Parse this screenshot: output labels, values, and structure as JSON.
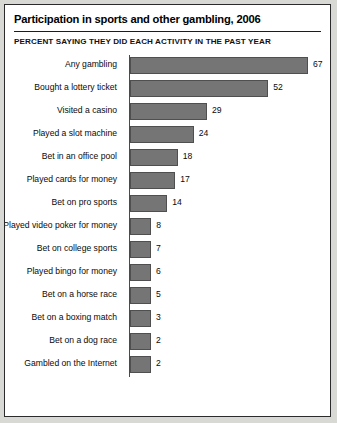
{
  "chart_data": {
    "type": "bar",
    "orientation": "horizontal",
    "title": "Participation in sports and other gambling, 2006",
    "subtitle": "PERCENT SAYING THEY DID EACH ACTIVITY IN THE PAST YEAR",
    "xlabel": "",
    "ylabel": "",
    "xlim": [
      0,
      67
    ],
    "grid": false,
    "legend": false,
    "bar_color": "#757575",
    "bar_border_color": "#4f4f4f",
    "axis_color": "#4a4a4a",
    "background": "#ffffff",
    "categories": [
      "Any gambling",
      "Bought a lottery ticket",
      "Visited a casino",
      "Played a slot machine",
      "Bet in an office pool",
      "Played cards for money",
      "Bet on pro sports",
      "Played video poker for money",
      "Bet on college sports",
      "Played bingo for money",
      "Bet on a horse race",
      "Bet on a boxing match",
      "Bet on a dog race",
      "Gambled on the Internet"
    ],
    "values": [
      67,
      52,
      29,
      24,
      18,
      17,
      14,
      8,
      7,
      6,
      5,
      3,
      2,
      2
    ],
    "value_labels": [
      "67",
      "52",
      "29",
      "24",
      "18",
      "17",
      "14",
      "8",
      "7",
      "6",
      "5",
      "3",
      "2",
      "2"
    ]
  }
}
